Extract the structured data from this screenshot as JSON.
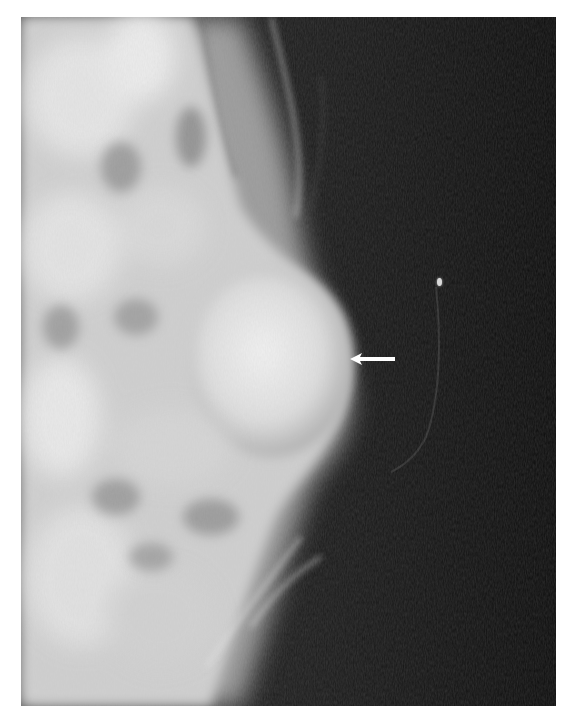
{
  "image": {
    "type": "mammogram",
    "description": "Grayscale breast radiograph with an oval dense mass; white arrow points to mass margin",
    "background_color": "#ffffff",
    "film_color": "#0d0d0d",
    "tissue_color": "#d8d8d8"
  },
  "annotation": {
    "arrow": {
      "direction": "left",
      "color": "#ffffff",
      "tip_x": 350,
      "tip_y": 358,
      "tail_x": 393
    },
    "marker": {
      "label": "skin marker",
      "x": 438,
      "y": 282
    }
  }
}
